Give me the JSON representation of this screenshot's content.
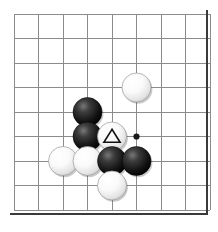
{
  "diagram": {
    "kind": "go-board-diagram",
    "board": {
      "width_px": 218,
      "height_px": 232,
      "background_color": "#ffffff",
      "grid_line_color": "#8c8c8c",
      "edge_line_color": "#3a3a3a",
      "columns": 8,
      "rows": 8,
      "origin_x": 14,
      "origin_y": 14,
      "spacing_x": 24.5,
      "spacing_y": 24.5,
      "edges": [
        {
          "side": "right",
          "x": 207,
          "y1": 10,
          "y2": 215
        },
        {
          "side": "bottom",
          "y": 214,
          "x1": 10,
          "x2": 208
        }
      ]
    },
    "star_points": [
      {
        "name": "hoshi-5-5",
        "col": 5,
        "row": 5,
        "radius": 3.1,
        "color": "#1a1a1a"
      }
    ],
    "stones": [
      {
        "id": "w1",
        "color": "white",
        "col": 5,
        "row": 3,
        "mark": null
      },
      {
        "id": "b1",
        "color": "black",
        "col": 3,
        "row": 4,
        "mark": null
      },
      {
        "id": "b2",
        "color": "black",
        "col": 3,
        "row": 5,
        "mark": null
      },
      {
        "id": "w2",
        "color": "white",
        "col": 4,
        "row": 5,
        "mark": "triangle"
      },
      {
        "id": "w3",
        "color": "white",
        "col": 2,
        "row": 6,
        "mark": null
      },
      {
        "id": "w4",
        "color": "white",
        "col": 3,
        "row": 6,
        "mark": null
      },
      {
        "id": "b3",
        "color": "black",
        "col": 4,
        "row": 6,
        "mark": null
      },
      {
        "id": "b4",
        "color": "black",
        "col": 5,
        "row": 6,
        "mark": null
      },
      {
        "id": "w5",
        "color": "white",
        "col": 4,
        "row": 7,
        "mark": null
      }
    ],
    "stone_style": {
      "radius": 14.5,
      "black_fill_center": "#5a5a5a",
      "black_fill_edge": "#000000",
      "white_fill_center": "#ffffff",
      "white_fill_edge": "#c9c9c9",
      "white_outline": "#9a9a9a"
    },
    "marks": {
      "triangle": {
        "label": "triangle-marker",
        "stroke": "#111111",
        "fill": "none"
      }
    }
  }
}
